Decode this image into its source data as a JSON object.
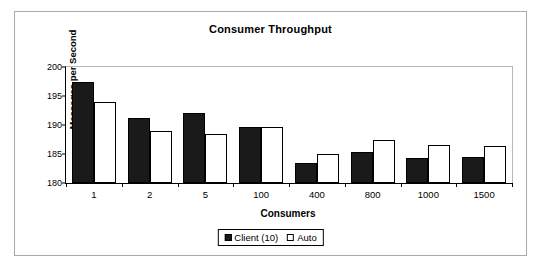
{
  "chart_data": {
    "type": "bar",
    "title": "Consumer Throughput",
    "xlabel": "Consumers",
    "ylabel": "Messages per Second",
    "categories": [
      "1",
      "2",
      "5",
      "100",
      "400",
      "800",
      "1000",
      "1500"
    ],
    "series": [
      {
        "name": "Client (10)",
        "color": "#1a1a1a",
        "values": [
          197.5,
          191.2,
          192.1,
          189.7,
          183.4,
          185.3,
          184.3,
          184.5
        ]
      },
      {
        "name": "Auto",
        "color": "#ffffff",
        "values": [
          193.9,
          189.0,
          188.4,
          189.6,
          185.0,
          187.4,
          186.6,
          186.3
        ]
      }
    ],
    "ylim": [
      180,
      200
    ],
    "yticks": [
      "180",
      "185",
      "190",
      "195",
      "200"
    ],
    "ytick_values": [
      180,
      185,
      190,
      195,
      200
    ],
    "grid": false,
    "legend_position": "bottom"
  },
  "legend": {
    "entries": [
      {
        "label": "Client (10)",
        "swatch": "filled-black-square"
      },
      {
        "label": "Auto",
        "swatch": "hollow-white-square"
      }
    ]
  },
  "colors": {
    "series_client": "#1a1a1a",
    "series_auto": "#ffffff",
    "axis": "#000000",
    "frame": "#a9a9a9",
    "plot_border_light": "#b8b8b8",
    "background": "#ffffff"
  }
}
